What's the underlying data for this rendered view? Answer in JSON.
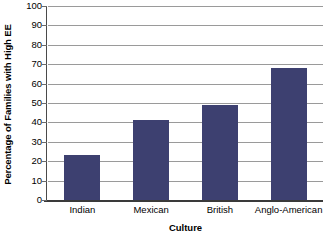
{
  "chart_data": {
    "type": "bar",
    "title": "",
    "subtitle": "",
    "categories": [
      "Indian",
      "Mexican",
      "British",
      "Anglo-American"
    ],
    "values": [
      23,
      41,
      49,
      68
    ],
    "xlabel": "Culture",
    "ylabel": "Percentage of Families with High EE",
    "ylim": [
      0,
      100
    ],
    "ytick_step": 10,
    "yticks": [
      "100",
      "90",
      "80",
      "70",
      "60",
      "50",
      "40",
      "30",
      "20",
      "10",
      "0"
    ],
    "grid": true,
    "grid_axis": "y",
    "legend": false,
    "legend_position": "none",
    "bar_color": "#3d4070",
    "gridline_color": "#9a9a9a",
    "axis_color": "#3a3a3a",
    "background_color": "#ffffff"
  }
}
